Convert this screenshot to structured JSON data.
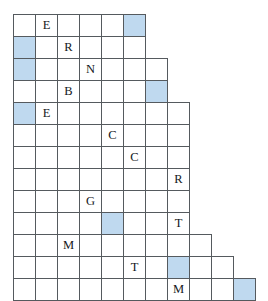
{
  "puzzle": {
    "type": "staircase-letter-grid",
    "cell_size_px": 23,
    "origin": {
      "x": 13,
      "y": 14
    },
    "rows_count": 13,
    "colors": {
      "highlight": "#bfd9ef",
      "grid_line": "#555a5e",
      "background": "#ffffff",
      "letter": "#14181c"
    },
    "row_lengths": [
      6,
      6,
      7,
      7,
      8,
      8,
      8,
      8,
      8,
      8,
      9,
      10,
      11
    ],
    "rows": [
      {
        "index": 1,
        "cells": [
          {
            "col": 1,
            "letter": "",
            "highlight": false
          },
          {
            "col": 2,
            "letter": "E",
            "highlight": false
          },
          {
            "col": 3,
            "letter": "",
            "highlight": false
          },
          {
            "col": 4,
            "letter": "",
            "highlight": false
          },
          {
            "col": 5,
            "letter": "",
            "highlight": false
          },
          {
            "col": 6,
            "letter": "",
            "highlight": true
          }
        ]
      },
      {
        "index": 2,
        "cells": [
          {
            "col": 1,
            "letter": "",
            "highlight": true
          },
          {
            "col": 2,
            "letter": "",
            "highlight": false
          },
          {
            "col": 3,
            "letter": "R",
            "highlight": false
          },
          {
            "col": 4,
            "letter": "",
            "highlight": false
          },
          {
            "col": 5,
            "letter": "",
            "highlight": false
          },
          {
            "col": 6,
            "letter": "",
            "highlight": false
          }
        ]
      },
      {
        "index": 3,
        "cells": [
          {
            "col": 1,
            "letter": "",
            "highlight": true
          },
          {
            "col": 2,
            "letter": "",
            "highlight": false
          },
          {
            "col": 3,
            "letter": "",
            "highlight": false
          },
          {
            "col": 4,
            "letter": "N",
            "highlight": false
          },
          {
            "col": 5,
            "letter": "",
            "highlight": false
          },
          {
            "col": 6,
            "letter": "",
            "highlight": false
          },
          {
            "col": 7,
            "letter": "",
            "highlight": false
          }
        ]
      },
      {
        "index": 4,
        "cells": [
          {
            "col": 1,
            "letter": "",
            "highlight": false
          },
          {
            "col": 2,
            "letter": "",
            "highlight": false
          },
          {
            "col": 3,
            "letter": "B",
            "highlight": false
          },
          {
            "col": 4,
            "letter": "",
            "highlight": false
          },
          {
            "col": 5,
            "letter": "",
            "highlight": false
          },
          {
            "col": 6,
            "letter": "",
            "highlight": false
          },
          {
            "col": 7,
            "letter": "",
            "highlight": true
          }
        ]
      },
      {
        "index": 5,
        "cells": [
          {
            "col": 1,
            "letter": "",
            "highlight": true
          },
          {
            "col": 2,
            "letter": "E",
            "highlight": false
          },
          {
            "col": 3,
            "letter": "",
            "highlight": false
          },
          {
            "col": 4,
            "letter": "",
            "highlight": false
          },
          {
            "col": 5,
            "letter": "",
            "highlight": false
          },
          {
            "col": 6,
            "letter": "",
            "highlight": false
          },
          {
            "col": 7,
            "letter": "",
            "highlight": false
          },
          {
            "col": 8,
            "letter": "",
            "highlight": false
          }
        ]
      },
      {
        "index": 6,
        "cells": [
          {
            "col": 1,
            "letter": "",
            "highlight": false
          },
          {
            "col": 2,
            "letter": "",
            "highlight": false
          },
          {
            "col": 3,
            "letter": "",
            "highlight": false
          },
          {
            "col": 4,
            "letter": "",
            "highlight": false
          },
          {
            "col": 5,
            "letter": "C",
            "highlight": false
          },
          {
            "col": 6,
            "letter": "",
            "highlight": false
          },
          {
            "col": 7,
            "letter": "",
            "highlight": false
          },
          {
            "col": 8,
            "letter": "",
            "highlight": false
          }
        ]
      },
      {
        "index": 7,
        "cells": [
          {
            "col": 1,
            "letter": "",
            "highlight": false
          },
          {
            "col": 2,
            "letter": "",
            "highlight": false
          },
          {
            "col": 3,
            "letter": "",
            "highlight": false
          },
          {
            "col": 4,
            "letter": "",
            "highlight": false
          },
          {
            "col": 5,
            "letter": "",
            "highlight": false
          },
          {
            "col": 6,
            "letter": "C",
            "highlight": false
          },
          {
            "col": 7,
            "letter": "",
            "highlight": false
          },
          {
            "col": 8,
            "letter": "",
            "highlight": false
          }
        ]
      },
      {
        "index": 8,
        "cells": [
          {
            "col": 1,
            "letter": "",
            "highlight": false
          },
          {
            "col": 2,
            "letter": "",
            "highlight": false
          },
          {
            "col": 3,
            "letter": "",
            "highlight": false
          },
          {
            "col": 4,
            "letter": "",
            "highlight": false
          },
          {
            "col": 5,
            "letter": "",
            "highlight": false
          },
          {
            "col": 6,
            "letter": "",
            "highlight": false
          },
          {
            "col": 7,
            "letter": "",
            "highlight": false
          },
          {
            "col": 8,
            "letter": "R",
            "highlight": false
          }
        ]
      },
      {
        "index": 9,
        "cells": [
          {
            "col": 1,
            "letter": "",
            "highlight": false
          },
          {
            "col": 2,
            "letter": "",
            "highlight": false
          },
          {
            "col": 3,
            "letter": "",
            "highlight": false
          },
          {
            "col": 4,
            "letter": "G",
            "highlight": false
          },
          {
            "col": 5,
            "letter": "",
            "highlight": false
          },
          {
            "col": 6,
            "letter": "",
            "highlight": false
          },
          {
            "col": 7,
            "letter": "",
            "highlight": false
          },
          {
            "col": 8,
            "letter": "",
            "highlight": false
          }
        ]
      },
      {
        "index": 10,
        "cells": [
          {
            "col": 1,
            "letter": "",
            "highlight": false
          },
          {
            "col": 2,
            "letter": "",
            "highlight": false
          },
          {
            "col": 3,
            "letter": "",
            "highlight": false
          },
          {
            "col": 4,
            "letter": "",
            "highlight": false
          },
          {
            "col": 5,
            "letter": "",
            "highlight": true
          },
          {
            "col": 6,
            "letter": "",
            "highlight": false
          },
          {
            "col": 7,
            "letter": "",
            "highlight": false
          },
          {
            "col": 8,
            "letter": "T",
            "highlight": false
          }
        ]
      },
      {
        "index": 11,
        "cells": [
          {
            "col": 1,
            "letter": "",
            "highlight": false
          },
          {
            "col": 2,
            "letter": "",
            "highlight": false
          },
          {
            "col": 3,
            "letter": "M",
            "highlight": false
          },
          {
            "col": 4,
            "letter": "",
            "highlight": false
          },
          {
            "col": 5,
            "letter": "",
            "highlight": false
          },
          {
            "col": 6,
            "letter": "",
            "highlight": false
          },
          {
            "col": 7,
            "letter": "",
            "highlight": false
          },
          {
            "col": 8,
            "letter": "",
            "highlight": false
          },
          {
            "col": 9,
            "letter": "",
            "highlight": false
          }
        ]
      },
      {
        "index": 12,
        "cells": [
          {
            "col": 1,
            "letter": "",
            "highlight": false
          },
          {
            "col": 2,
            "letter": "",
            "highlight": false
          },
          {
            "col": 3,
            "letter": "",
            "highlight": false
          },
          {
            "col": 4,
            "letter": "",
            "highlight": false
          },
          {
            "col": 5,
            "letter": "",
            "highlight": false
          },
          {
            "col": 6,
            "letter": "T",
            "highlight": false
          },
          {
            "col": 7,
            "letter": "",
            "highlight": false
          },
          {
            "col": 8,
            "letter": "",
            "highlight": true
          },
          {
            "col": 9,
            "letter": "",
            "highlight": false
          },
          {
            "col": 10,
            "letter": "",
            "highlight": false
          }
        ]
      },
      {
        "index": 13,
        "cells": [
          {
            "col": 1,
            "letter": "",
            "highlight": false
          },
          {
            "col": 2,
            "letter": "",
            "highlight": false
          },
          {
            "col": 3,
            "letter": "",
            "highlight": false
          },
          {
            "col": 4,
            "letter": "",
            "highlight": false
          },
          {
            "col": 5,
            "letter": "",
            "highlight": false
          },
          {
            "col": 6,
            "letter": "",
            "highlight": false
          },
          {
            "col": 7,
            "letter": "",
            "highlight": false
          },
          {
            "col": 8,
            "letter": "M",
            "highlight": false
          },
          {
            "col": 9,
            "letter": "",
            "highlight": false
          },
          {
            "col": 10,
            "letter": "",
            "highlight": false
          },
          {
            "col": 11,
            "letter": "",
            "highlight": true
          }
        ]
      }
    ]
  }
}
